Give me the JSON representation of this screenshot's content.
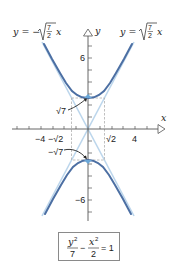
{
  "diagram": {
    "type": "hyperbola-graph",
    "equation": {
      "lhs_num1": "y",
      "lhs_exp1": "2",
      "lhs_den1": "7",
      "minus": "−",
      "lhs_num2": "x",
      "lhs_exp2": "2",
      "lhs_den2": "2",
      "rhs": "= 1"
    },
    "asymptote_left": {
      "prefix": "y = −",
      "frac_num": "7",
      "frac_den": "2",
      "suffix": "x"
    },
    "asymptote_right": {
      "prefix": "y =",
      "frac_num": "7",
      "frac_den": "2",
      "suffix": "x"
    },
    "axes": {
      "x_label": "x",
      "y_label": "y"
    },
    "x_ticks": {
      "neg4": "−4",
      "neg_sqrt2": "−√2",
      "sqrt2": "√2",
      "pos4": "4"
    },
    "y_ticks": {
      "pos6": "6",
      "neg6": "−6"
    },
    "vertex_labels": {
      "top": "√7",
      "bottom": "−√7"
    },
    "colors": {
      "curve": "#4a6fa5",
      "asymptote": "#b9d4ea",
      "axis": "#555555",
      "box": "#999999"
    }
  }
}
